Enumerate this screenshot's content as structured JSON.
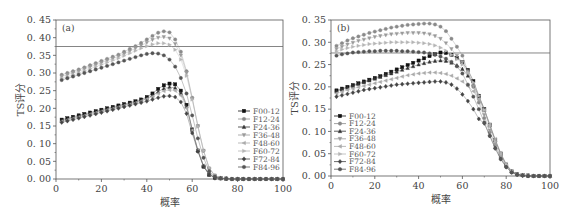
{
  "chart_data": [
    {
      "type": "line",
      "panel_label": "(a)",
      "xlabel": "概率",
      "ylabel": "TS评分",
      "xlim": [
        0,
        100
      ],
      "ylim": [
        0,
        0.45
      ],
      "xticks": [
        0,
        20,
        40,
        60,
        80,
        100
      ],
      "yticks": [
        "0.00",
        "0.05",
        "0.10",
        "0.15",
        "0.20",
        "0.25",
        "0.30",
        "0.35",
        "0.40",
        "0.45"
      ],
      "reference_line_y": 0.375,
      "legend_position": "right-middle",
      "x": [
        2.5,
        5,
        7.5,
        10,
        12.5,
        15,
        17.5,
        20,
        22.5,
        25,
        27.5,
        30,
        32.5,
        35,
        37.5,
        40,
        42.5,
        45,
        47.5,
        50,
        52.5,
        55,
        57.5,
        60,
        62.5,
        65,
        67.5,
        70,
        72.5,
        75,
        77.5,
        80,
        82.5,
        85,
        87.5,
        90,
        92.5,
        95,
        97.5,
        100
      ],
      "series": [
        {
          "name": "F00-12",
          "marker": "square",
          "color": "#111111",
          "values": [
            0.168,
            0.172,
            0.176,
            0.18,
            0.184,
            0.188,
            0.192,
            0.196,
            0.2,
            0.204,
            0.208,
            0.212,
            0.216,
            0.22,
            0.225,
            0.232,
            0.242,
            0.255,
            0.265,
            0.27,
            0.268,
            0.25,
            0.21,
            0.14,
            0.08,
            0.035,
            0.012,
            0.004,
            0.002,
            0.001,
            0,
            0,
            0,
            0,
            0,
            0,
            0,
            0,
            0,
            0
          ]
        },
        {
          "name": "F12-24",
          "marker": "circle",
          "color": "#8a8a8a",
          "values": [
            0.295,
            0.3,
            0.305,
            0.31,
            0.316,
            0.322,
            0.328,
            0.334,
            0.34,
            0.346,
            0.352,
            0.36,
            0.368,
            0.376,
            0.385,
            0.395,
            0.405,
            0.414,
            0.418,
            0.415,
            0.395,
            0.36,
            0.305,
            0.23,
            0.15,
            0.08,
            0.03,
            0.01,
            0.003,
            0.001,
            0,
            0,
            0,
            0,
            0,
            0,
            0,
            0,
            0,
            0
          ]
        },
        {
          "name": "F24-36",
          "marker": "triangle-up",
          "color": "#333333",
          "values": [
            0.165,
            0.169,
            0.173,
            0.177,
            0.181,
            0.185,
            0.189,
            0.193,
            0.197,
            0.201,
            0.205,
            0.209,
            0.213,
            0.217,
            0.222,
            0.228,
            0.236,
            0.247,
            0.256,
            0.26,
            0.258,
            0.243,
            0.205,
            0.14,
            0.082,
            0.037,
            0.013,
            0.004,
            0.002,
            0.001,
            0,
            0,
            0,
            0,
            0,
            0,
            0,
            0,
            0,
            0
          ]
        },
        {
          "name": "F36-48",
          "marker": "triangle-down",
          "color": "#9a9a9a",
          "values": [
            0.29,
            0.295,
            0.3,
            0.305,
            0.311,
            0.317,
            0.323,
            0.329,
            0.335,
            0.341,
            0.347,
            0.354,
            0.362,
            0.37,
            0.378,
            0.386,
            0.394,
            0.4,
            0.402,
            0.398,
            0.382,
            0.35,
            0.3,
            0.228,
            0.15,
            0.08,
            0.03,
            0.01,
            0.003,
            0.001,
            0,
            0,
            0,
            0,
            0,
            0,
            0,
            0,
            0,
            0
          ]
        },
        {
          "name": "F48-60",
          "marker": "triangle-left",
          "color": "#aaaaaa",
          "values": [
            0.163,
            0.167,
            0.171,
            0.175,
            0.179,
            0.183,
            0.187,
            0.191,
            0.195,
            0.199,
            0.203,
            0.207,
            0.211,
            0.215,
            0.22,
            0.226,
            0.233,
            0.242,
            0.249,
            0.252,
            0.25,
            0.236,
            0.2,
            0.138,
            0.082,
            0.038,
            0.014,
            0.005,
            0.002,
            0.001,
            0,
            0,
            0,
            0,
            0,
            0,
            0,
            0,
            0,
            0
          ]
        },
        {
          "name": "F60-72",
          "marker": "triangle-right",
          "color": "#b5b5b5",
          "values": [
            0.285,
            0.29,
            0.295,
            0.3,
            0.306,
            0.312,
            0.318,
            0.324,
            0.33,
            0.336,
            0.342,
            0.349,
            0.356,
            0.363,
            0.37,
            0.376,
            0.381,
            0.384,
            0.384,
            0.38,
            0.366,
            0.338,
            0.292,
            0.225,
            0.148,
            0.08,
            0.031,
            0.01,
            0.003,
            0.001,
            0,
            0,
            0,
            0,
            0,
            0,
            0,
            0,
            0,
            0
          ]
        },
        {
          "name": "F72-84",
          "marker": "diamond",
          "color": "#444444",
          "values": [
            0.16,
            0.164,
            0.168,
            0.172,
            0.176,
            0.18,
            0.184,
            0.188,
            0.192,
            0.196,
            0.2,
            0.204,
            0.208,
            0.212,
            0.216,
            0.22,
            0.225,
            0.23,
            0.234,
            0.235,
            0.232,
            0.218,
            0.185,
            0.13,
            0.078,
            0.036,
            0.013,
            0.004,
            0.002,
            0.001,
            0,
            0,
            0,
            0,
            0,
            0,
            0,
            0,
            0,
            0
          ]
        },
        {
          "name": "F84-96",
          "marker": "hexagon",
          "color": "#555555",
          "values": [
            0.28,
            0.285,
            0.29,
            0.295,
            0.3,
            0.305,
            0.31,
            0.315,
            0.32,
            0.325,
            0.33,
            0.335,
            0.34,
            0.345,
            0.35,
            0.354,
            0.356,
            0.355,
            0.35,
            0.338,
            0.318,
            0.286,
            0.242,
            0.18,
            0.115,
            0.06,
            0.022,
            0.007,
            0.002,
            0.001,
            0,
            0,
            0,
            0,
            0,
            0,
            0,
            0,
            0,
            0
          ]
        }
      ]
    },
    {
      "type": "line",
      "panel_label": "(b)",
      "xlabel": "概率",
      "ylabel": "TS评分",
      "xlim": [
        0,
        100
      ],
      "ylim": [
        0,
        0.35
      ],
      "xticks": [
        0,
        20,
        40,
        60,
        80,
        100
      ],
      "yticks": [
        "0.00",
        "0.05",
        "0.10",
        "0.15",
        "0.20",
        "0.25",
        "0.30",
        "0.35"
      ],
      "reference_line_y": 0.276,
      "legend_position": "left-middle",
      "x": [
        2.5,
        5,
        7.5,
        10,
        12.5,
        15,
        17.5,
        20,
        22.5,
        25,
        27.5,
        30,
        32.5,
        35,
        37.5,
        40,
        42.5,
        45,
        47.5,
        50,
        52.5,
        55,
        57.5,
        60,
        62.5,
        65,
        67.5,
        70,
        72.5,
        75,
        77.5,
        80,
        82.5,
        85,
        87.5,
        90,
        92.5,
        95,
        97.5,
        100
      ],
      "series": [
        {
          "name": "F00-12",
          "marker": "square",
          "color": "#111111",
          "values": [
            0.192,
            0.196,
            0.2,
            0.204,
            0.208,
            0.212,
            0.216,
            0.22,
            0.224,
            0.229,
            0.234,
            0.239,
            0.244,
            0.249,
            0.254,
            0.259,
            0.264,
            0.269,
            0.273,
            0.277,
            0.276,
            0.272,
            0.265,
            0.255,
            0.238,
            0.213,
            0.18,
            0.15,
            0.115,
            0.08,
            0.05,
            0.025,
            0.01,
            0.004,
            0.002,
            0.001,
            0,
            0,
            0,
            0
          ]
        },
        {
          "name": "F12-24",
          "marker": "circle",
          "color": "#8a8a8a",
          "values": [
            0.292,
            0.298,
            0.304,
            0.309,
            0.313,
            0.317,
            0.321,
            0.324,
            0.327,
            0.33,
            0.333,
            0.335,
            0.337,
            0.339,
            0.34,
            0.341,
            0.342,
            0.342,
            0.34,
            0.335,
            0.325,
            0.308,
            0.29,
            0.27,
            0.235,
            0.2,
            0.165,
            0.13,
            0.098,
            0.068,
            0.042,
            0.022,
            0.01,
            0.004,
            0.002,
            0.001,
            0,
            0,
            0,
            0
          ]
        },
        {
          "name": "F24-36",
          "marker": "triangle-up",
          "color": "#333333",
          "values": [
            0.19,
            0.194,
            0.198,
            0.202,
            0.206,
            0.21,
            0.214,
            0.218,
            0.222,
            0.226,
            0.23,
            0.234,
            0.238,
            0.242,
            0.246,
            0.25,
            0.253,
            0.256,
            0.258,
            0.259,
            0.258,
            0.254,
            0.248,
            0.24,
            0.225,
            0.205,
            0.178,
            0.148,
            0.113,
            0.08,
            0.05,
            0.026,
            0.011,
            0.004,
            0.002,
            0.001,
            0,
            0,
            0,
            0
          ]
        },
        {
          "name": "F36-48",
          "marker": "triangle-down",
          "color": "#9a9a9a",
          "values": [
            0.285,
            0.29,
            0.295,
            0.299,
            0.303,
            0.306,
            0.309,
            0.312,
            0.314,
            0.316,
            0.318,
            0.319,
            0.32,
            0.321,
            0.321,
            0.321,
            0.32,
            0.318,
            0.314,
            0.308,
            0.298,
            0.285,
            0.27,
            0.255,
            0.232,
            0.202,
            0.17,
            0.137,
            0.102,
            0.071,
            0.044,
            0.023,
            0.01,
            0.004,
            0.002,
            0.001,
            0,
            0,
            0,
            0
          ]
        },
        {
          "name": "F48-60",
          "marker": "triangle-left",
          "color": "#aaaaaa",
          "values": [
            0.185,
            0.189,
            0.193,
            0.196,
            0.199,
            0.202,
            0.205,
            0.208,
            0.211,
            0.214,
            0.217,
            0.22,
            0.223,
            0.226,
            0.228,
            0.23,
            0.231,
            0.232,
            0.232,
            0.231,
            0.229,
            0.225,
            0.219,
            0.212,
            0.202,
            0.19,
            0.172,
            0.148,
            0.116,
            0.083,
            0.052,
            0.027,
            0.011,
            0.004,
            0.002,
            0.001,
            0,
            0,
            0,
            0
          ]
        },
        {
          "name": "F60-72",
          "marker": "triangle-right",
          "color": "#b5b5b5",
          "values": [
            0.28,
            0.284,
            0.287,
            0.29,
            0.292,
            0.294,
            0.296,
            0.297,
            0.298,
            0.299,
            0.3,
            0.3,
            0.3,
            0.3,
            0.3,
            0.299,
            0.298,
            0.296,
            0.293,
            0.288,
            0.281,
            0.272,
            0.262,
            0.25,
            0.232,
            0.21,
            0.18,
            0.148,
            0.112,
            0.078,
            0.049,
            0.025,
            0.011,
            0.004,
            0.002,
            0.001,
            0,
            0,
            0,
            0
          ]
        },
        {
          "name": "F72-84",
          "marker": "diamond",
          "color": "#444444",
          "values": [
            0.178,
            0.181,
            0.184,
            0.187,
            0.19,
            0.193,
            0.195,
            0.197,
            0.199,
            0.201,
            0.203,
            0.205,
            0.206,
            0.207,
            0.208,
            0.209,
            0.21,
            0.211,
            0.212,
            0.212,
            0.21,
            0.205,
            0.196,
            0.183,
            0.168,
            0.15,
            0.128,
            0.118,
            0.09,
            0.062,
            0.038,
            0.02,
            0.008,
            0.003,
            0.001,
            0,
            0,
            0,
            0,
            0
          ]
        },
        {
          "name": "F84-96",
          "marker": "hexagon",
          "color": "#555555",
          "values": [
            0.27,
            0.273,
            0.275,
            0.277,
            0.278,
            0.279,
            0.28,
            0.28,
            0.281,
            0.281,
            0.281,
            0.281,
            0.28,
            0.28,
            0.279,
            0.278,
            0.277,
            0.275,
            0.272,
            0.268,
            0.263,
            0.256,
            0.246,
            0.23,
            0.205,
            0.178,
            0.15,
            0.12,
            0.09,
            0.062,
            0.038,
            0.02,
            0.008,
            0.003,
            0.001,
            0,
            0,
            0,
            0,
            0
          ]
        }
      ]
    }
  ]
}
